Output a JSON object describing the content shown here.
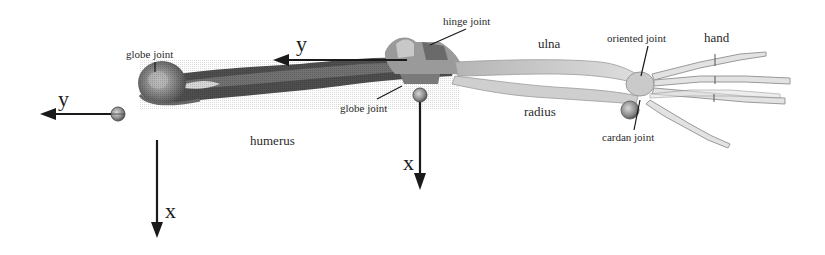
{
  "figure": {
    "type": "arm skeleton joint diagram",
    "labels": {
      "globe_joint_shoulder": "globe joint",
      "hinge_joint": "hinge joint",
      "globe_joint_elbow": "globe joint",
      "oriented_joint": "oriented joint",
      "cardan_joint": "cardan joint",
      "humerus": "humerus",
      "ulna": "ulna",
      "radius": "radius",
      "hand": "hand"
    },
    "axes": {
      "shoulder": {
        "y": "y",
        "x": "x"
      },
      "elbow": {
        "y": "y",
        "x": "x"
      }
    },
    "colors": {
      "bone_dark": "#4a4a4a",
      "bone_mid": "#8a8a8a",
      "bone_light": "#c8c8c8",
      "arrow": "#1a1a1a"
    }
  }
}
